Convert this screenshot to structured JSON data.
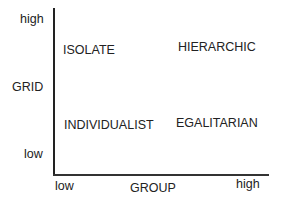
{
  "y_axis": {
    "label": "GRID",
    "high": "high",
    "low": "low"
  },
  "x_axis": {
    "label": "GROUP",
    "low": "low",
    "high": "high"
  },
  "quadrants": {
    "top_left": "ISOLATE",
    "top_right": "HIERARCHIC",
    "bottom_left": "INDIVIDUALIST",
    "bottom_right": "EGALITARIAN"
  }
}
